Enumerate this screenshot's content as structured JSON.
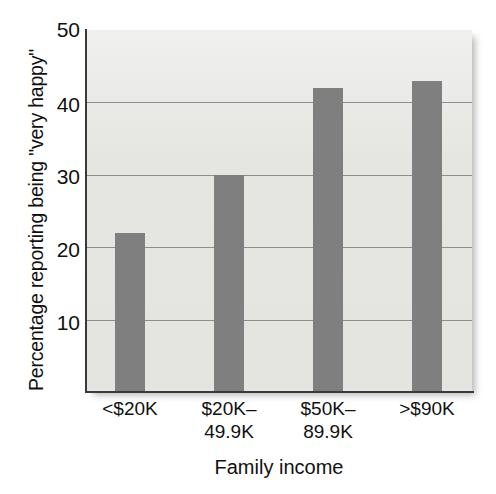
{
  "chart_data": {
    "type": "bar",
    "title": "",
    "xlabel": "Family income",
    "ylabel": "Percentage reporting being \"very happy\"",
    "categories": [
      "<$20K",
      "$20K–49.9K",
      "$50K–89.9K",
      ">$90K"
    ],
    "category_lines": [
      {
        "line1": "<$20K",
        "line2": ""
      },
      {
        "line1": "$20K–",
        "line2": "49.9K"
      },
      {
        "line1": "$50K–",
        "line2": "89.9K"
      },
      {
        "line1": ">$90K",
        "line2": ""
      }
    ],
    "values": [
      22,
      30,
      42,
      43
    ],
    "ylim": [
      0,
      50
    ],
    "yticks": [
      50,
      40,
      30,
      20,
      10
    ],
    "ytick_labels": [
      "50",
      "40",
      "30",
      "20",
      "10"
    ],
    "grid": true,
    "grid_axis": "y",
    "legend": false,
    "bar_color": "#7f7f7f",
    "plot_background": "#e4e4e1",
    "gridline_color": "#8d8d8d",
    "axis_color": "#3a3a3a"
  }
}
